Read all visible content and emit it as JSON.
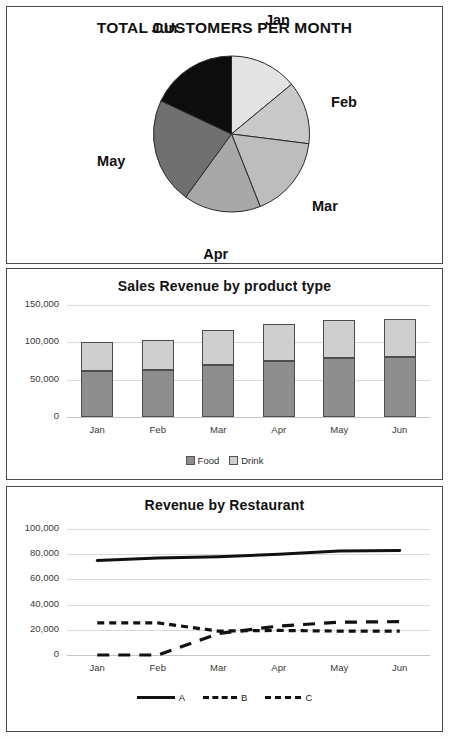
{
  "pie_panel": {
    "title": "TOTAL CUSTOMERS PER MONTH",
    "labels": [
      "Jan",
      "Feb",
      "Mar",
      "Apr",
      "May",
      "Jun"
    ]
  },
  "bar_panel": {
    "title": "Sales Revenue by product type",
    "legend": [
      "Food",
      "Drink"
    ]
  },
  "line_panel": {
    "title": "Revenue by Restaurant",
    "legend": [
      "A",
      "B",
      "C"
    ]
  },
  "chart_data": [
    {
      "type": "pie",
      "title": "TOTAL CUSTOMERS PER MONTH",
      "categories": [
        "Jan",
        "Feb",
        "Mar",
        "Apr",
        "May",
        "Jun"
      ],
      "values": [
        14,
        13,
        17,
        16,
        22,
        18
      ],
      "unit": "percent",
      "start_angle": 0,
      "direction": "clockwise",
      "colors": [
        "#e3e3e3",
        "#c9c9c9",
        "#bdbdbd",
        "#a8a8a8",
        "#707070",
        "#0d0d0d"
      ],
      "legend": "none",
      "labels_position": "outside"
    },
    {
      "type": "bar",
      "subtype": "stacked",
      "title": "Sales Revenue by product type",
      "categories": [
        "Jan",
        "Feb",
        "Mar",
        "Apr",
        "May",
        "Jun"
      ],
      "series": [
        {
          "name": "Food",
          "values": [
            62000,
            63000,
            70000,
            75000,
            79000,
            80000
          ],
          "color": "#8e8e8e"
        },
        {
          "name": "Drink",
          "values": [
            39000,
            40000,
            46000,
            49000,
            51000,
            51000
          ],
          "color": "#cfcfcf"
        }
      ],
      "totals": [
        101000,
        103000,
        116000,
        124000,
        130000,
        131000
      ],
      "xlabel": "",
      "ylabel": "",
      "ylim": [
        0,
        150000
      ],
      "yticks": [
        0,
        50000,
        100000,
        150000
      ],
      "ytick_labels": [
        "0",
        "50,000",
        "100,000",
        "150,000"
      ],
      "grid": true,
      "legend_position": "bottom"
    },
    {
      "type": "line",
      "title": "Revenue by Restaurant",
      "x": [
        "Jan",
        "Feb",
        "Mar",
        "Apr",
        "May",
        "Jun"
      ],
      "series": [
        {
          "name": "A",
          "values": [
            75000,
            77000,
            78000,
            80000,
            82500,
            83000
          ],
          "style": "solid",
          "color": "#111111"
        },
        {
          "name": "B",
          "values": [
            25500,
            25500,
            19000,
            19500,
            19000,
            19000
          ],
          "style": "short-dash",
          "color": "#111111"
        },
        {
          "name": "C",
          "values": [
            0,
            0,
            17000,
            23000,
            26000,
            26500
          ],
          "style": "long-dash",
          "color": "#111111"
        }
      ],
      "xlabel": "",
      "ylabel": "",
      "ylim": [
        0,
        100000
      ],
      "yticks": [
        0,
        20000,
        40000,
        60000,
        80000,
        100000
      ],
      "ytick_labels": [
        "0",
        "20,000",
        "40,000",
        "60,000",
        "80,000",
        "100,000"
      ],
      "grid": true,
      "legend_position": "bottom"
    }
  ]
}
